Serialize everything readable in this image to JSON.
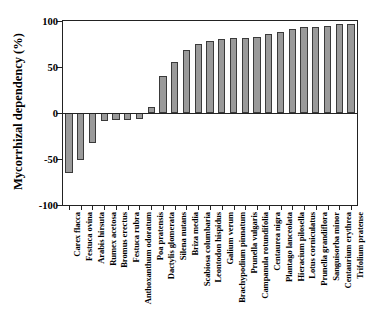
{
  "chart_data": {
    "type": "bar",
    "title": "",
    "xlabel": "",
    "ylabel": "Mycorrhizal dependency (%)",
    "ylim": [
      -100,
      100
    ],
    "yticks": [
      100,
      50,
      0,
      -50,
      -100
    ],
    "ytick_labels": [
      "100",
      "50",
      "0",
      "-50",
      "-100"
    ],
    "grid": false,
    "legend": "none",
    "bar_color": "#9a9a9a",
    "bar_edge_color": "#3a3a3a",
    "categories": [
      "Carex flacca",
      "Festuca ovina",
      "Arabis hirsuta",
      "Rumex acetosa",
      "Bromus erectus",
      "Festuca rubra",
      "Anthoxanthum odoratum",
      "Poa pratensis",
      "Dactylis glomerata",
      "Silena nutans",
      "Briza media",
      "Scabiosa columbaria",
      "Leontodon hispidus",
      "Galium verum",
      "Brachypodium pinnatum",
      "Prunella vulgaris",
      "Campanula rotundifolia",
      "Centaurea nigra",
      "Plantago lanceolata",
      "Hieracium pilosella",
      "Lotus corniculatus",
      "Prunella grandiflora",
      "Sanguisorba minor",
      "Centaurium erythrea",
      "Trifolium pratense"
    ],
    "values": [
      -65,
      -51,
      -33,
      -9,
      -8,
      -8,
      -6,
      7,
      40,
      55,
      68,
      75,
      78,
      80,
      81,
      82,
      83,
      86,
      88,
      91,
      94,
      94,
      95,
      97,
      97
    ]
  },
  "axis": {
    "y_title": "Mycorrhizal dependency (%)"
  }
}
